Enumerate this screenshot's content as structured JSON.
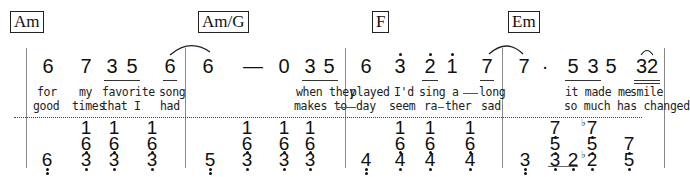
{
  "chords": [
    "Am",
    "Am/G",
    "F",
    "Em"
  ],
  "melody": {
    "m1": [
      "6",
      "7",
      "3",
      "5",
      "6"
    ],
    "m2": [
      "6",
      "—",
      "0",
      "3",
      "5"
    ],
    "m3": [
      "6",
      "3",
      "2",
      "1",
      "7"
    ],
    "m4": [
      "7",
      "·",
      "5",
      "3",
      "5",
      "32"
    ]
  },
  "lyrics": {
    "verse1": {
      "m1": [
        "for",
        "my",
        "favorite",
        "song"
      ],
      "m2": [
        "when they"
      ],
      "m3": [
        "played",
        "I'd",
        "sing a",
        "long"
      ],
      "m4": [
        "it made me",
        "smile"
      ]
    },
    "verse2": {
      "m1": [
        "good",
        "times",
        "that I",
        "had"
      ],
      "m2": [
        "makes to",
        "day"
      ],
      "m3": [
        "seem",
        "ra",
        "ther",
        "sad"
      ],
      "m4": [
        "so much has changed"
      ]
    }
  },
  "accompaniment": {
    "m1": {
      "bass": "6",
      "chords": [
        [
          "1",
          "6",
          "3"
        ],
        [
          "1",
          "6",
          "3"
        ],
        [
          "1",
          "6",
          "3"
        ]
      ]
    },
    "m2": {
      "bass": "5",
      "chords": [
        [
          "1",
          "6",
          "3"
        ],
        [
          "1",
          "6",
          "3"
        ],
        [
          "1",
          "6",
          "3"
        ]
      ]
    },
    "m3": {
      "bass": "4",
      "chords": [
        [
          "1",
          "6",
          "4"
        ],
        [
          "1",
          "6",
          "4"
        ]
      ]
    },
    "m4": {
      "bass": "3",
      "notes": [
        "7",
        "5",
        "3",
        "2",
        "7",
        "5",
        "2",
        "7",
        "5"
      ],
      "flat": "♭"
    }
  }
}
